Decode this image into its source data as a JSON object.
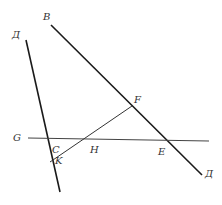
{
  "diagram": {
    "type": "geometry-construction",
    "stroke_color": "#1a1a1a",
    "thin_stroke_color": "#333333",
    "labels": {
      "B": "B",
      "D_top": "Д",
      "G": "G",
      "C": "C",
      "K": "K",
      "H": "H",
      "F": "F",
      "E": "E",
      "D_bottom": "Д"
    },
    "lines": [
      {
        "name": "line-d-top-to-bottom",
        "from": [
          26,
          40
        ],
        "to": [
          60,
          192
        ]
      },
      {
        "name": "line-b-to-d",
        "from": [
          51,
          27
        ],
        "to": [
          202,
          175
        ]
      },
      {
        "name": "line-g",
        "from": [
          28,
          138
        ],
        "to": [
          209,
          141
        ]
      },
      {
        "name": "segment-k-f",
        "from": [
          50,
          162
        ],
        "to": [
          132,
          106
        ]
      }
    ]
  }
}
